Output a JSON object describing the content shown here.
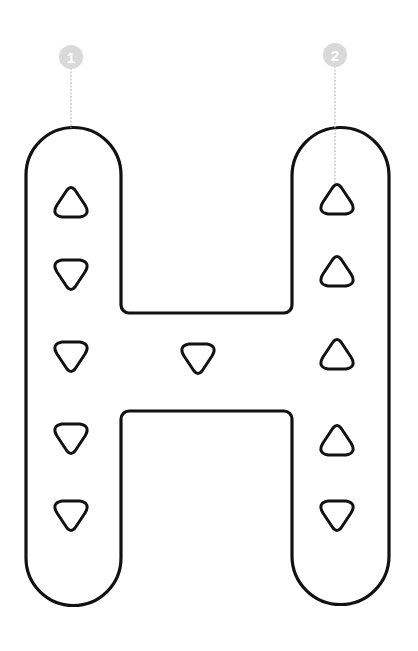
{
  "diagram": {
    "letter": "H",
    "colors": {
      "outline": "#111111",
      "badge": "#d9d9d9",
      "badge_text": "#ffffff",
      "guide_line": "#c8c8c8",
      "background": "#ffffff"
    },
    "badges": [
      {
        "label": "1",
        "cx": 71,
        "cy": 57,
        "line_to_y": 128
      },
      {
        "label": "2",
        "cx": 335,
        "cy": 55,
        "line_to_y": 183
      }
    ],
    "markers": [
      {
        "group": "left-stroke",
        "x": 71,
        "y": 203,
        "dir": "up"
      },
      {
        "group": "left-stroke",
        "x": 71,
        "y": 274,
        "dir": "down"
      },
      {
        "group": "left-stroke",
        "x": 71,
        "y": 356,
        "dir": "down"
      },
      {
        "group": "left-stroke",
        "x": 71,
        "y": 438,
        "dir": "down"
      },
      {
        "group": "left-stroke",
        "x": 71,
        "y": 515,
        "dir": "down"
      },
      {
        "group": "crossbar",
        "x": 198,
        "y": 358,
        "dir": "down"
      },
      {
        "group": "right-stroke",
        "x": 337,
        "y": 200,
        "dir": "up"
      },
      {
        "group": "right-stroke",
        "x": 337,
        "y": 272,
        "dir": "up"
      },
      {
        "group": "right-stroke",
        "x": 337,
        "y": 355,
        "dir": "up"
      },
      {
        "group": "right-stroke",
        "x": 337,
        "y": 441,
        "dir": "up"
      },
      {
        "group": "right-stroke",
        "x": 337,
        "y": 515,
        "dir": "down"
      }
    ]
  }
}
